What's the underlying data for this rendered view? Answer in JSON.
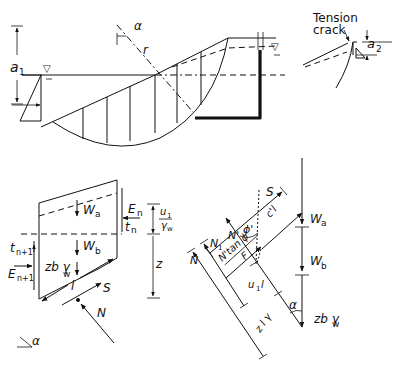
{
  "figure": {
    "type": "slope stability - method of slices",
    "colors": {
      "ink": "#111111",
      "background": "#ffffff"
    }
  },
  "slope_section": {
    "labels": {
      "a1": "a",
      "a1_sub": "1",
      "alpha": "α",
      "radius": "r",
      "water_table_symbol": "▽"
    }
  },
  "tension_crack_detail": {
    "title_line1": "Tension",
    "title_line2": "crack",
    "a2": "a",
    "a2_sub": "2"
  },
  "slice_free_body": {
    "labels": {
      "Wa": "W",
      "Wa_sub": "a",
      "Wb": "W",
      "Wb_sub": "b",
      "En": "E",
      "En_sub": "n",
      "tn": "t",
      "tn_sub": "n",
      "tn1": "t",
      "tn1_sub": "n+1",
      "En1": "E",
      "En1_sub": "n+1",
      "zb_gamma": "zb γ",
      "zb_gamma_sub": "w",
      "l": "l",
      "S": "S",
      "N": "N",
      "alpha": "α",
      "u1_num": "u",
      "u1_num_sub": "1",
      "u1_den": "γ",
      "u1_den_sub": "w",
      "z": "z"
    }
  },
  "force_polygon": {
    "labels": {
      "S": "S",
      "c_l_F_num": "c'l",
      "c_l_F_den": "F",
      "N_tan_phi_num": "N'tan ϕ'",
      "N_tan_phi_den": "F",
      "phi": "ϕ'",
      "N_prime": "N'",
      "N1": "N",
      "N1_sub": "1",
      "N": "N",
      "Wa": "W",
      "Wa_sub": "a",
      "Wb": "W",
      "Wb_sub": "b",
      "u1l": "u",
      "u1l_sub": "1",
      "u1l_tail": "l",
      "zl_gamma": "z l γ",
      "zl_gamma_sub": "w",
      "alpha": "α",
      "zb_gamma": "zb γ",
      "zb_gamma_sub": "w"
    }
  }
}
